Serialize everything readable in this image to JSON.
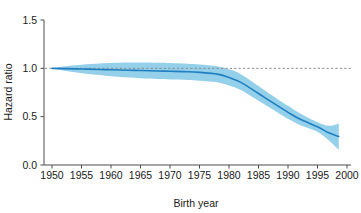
{
  "chart_data": {
    "type": "line",
    "title": "",
    "xlabel": "Birth year",
    "ylabel": "Hazard ratio",
    "xlim": [
      1950,
      2000
    ],
    "ylim": [
      0.0,
      1.5
    ],
    "grid": false,
    "legend": null,
    "xticks": [
      "1950",
      "1955",
      "1960",
      "1965",
      "1970",
      "1975",
      "1980",
      "1985",
      "1990",
      "1995",
      "2000"
    ],
    "xtick_values": [
      1950,
      1955,
      1960,
      1965,
      1970,
      1975,
      1980,
      1985,
      1990,
      1995,
      2000
    ],
    "yticks": [
      "0.0",
      "0.5",
      "1.0",
      "1.5"
    ],
    "ytick_values": [
      0.0,
      0.5,
      1.0,
      1.5
    ],
    "reference_line": {
      "y": 1.0,
      "style": "dashed",
      "color": "#808080"
    },
    "colors": {
      "line": "#1F7FC0",
      "band": "#8FCDEA",
      "axis": "#4d4d4d",
      "text": "#1a1a1a"
    },
    "series": [
      {
        "name": "Hazard ratio",
        "color": "#1F7FC0",
        "x": [
          1950,
          1952,
          1955,
          1958,
          1960,
          1963,
          1965,
          1968,
          1970,
          1973,
          1975,
          1978,
          1980,
          1982,
          1985,
          1987,
          1990,
          1992,
          1995,
          1997,
          1998.6
        ],
        "values": [
          1.0,
          0.997,
          0.993,
          0.988,
          0.985,
          0.98,
          0.977,
          0.973,
          0.97,
          0.965,
          0.958,
          0.94,
          0.905,
          0.855,
          0.74,
          0.66,
          0.545,
          0.475,
          0.395,
          0.33,
          0.295
        ],
        "ci_lower": [
          1.0,
          0.975,
          0.95,
          0.93,
          0.918,
          0.905,
          0.898,
          0.89,
          0.885,
          0.88,
          0.872,
          0.855,
          0.822,
          0.775,
          0.665,
          0.59,
          0.478,
          0.415,
          0.345,
          0.25,
          0.155
        ],
        "ci_upper": [
          1.0,
          1.02,
          1.038,
          1.05,
          1.055,
          1.06,
          1.06,
          1.058,
          1.055,
          1.048,
          1.04,
          1.022,
          0.99,
          0.94,
          0.818,
          0.733,
          0.612,
          0.535,
          0.443,
          0.405,
          0.43
        ]
      }
    ]
  }
}
